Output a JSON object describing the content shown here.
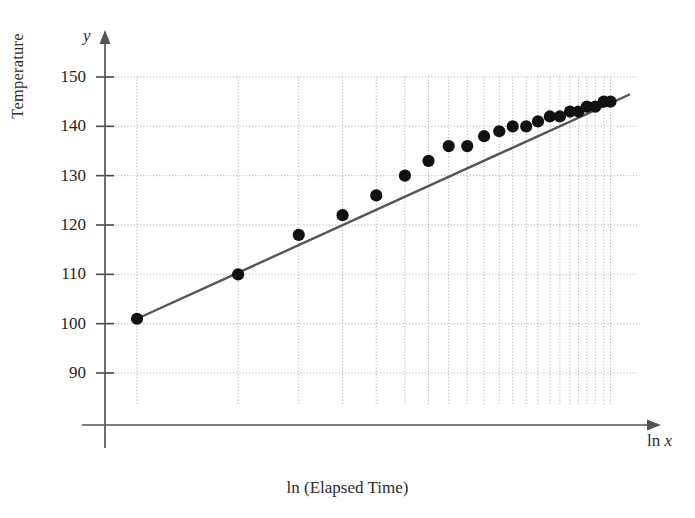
{
  "chart_data": {
    "type": "scatter",
    "title": "",
    "xlabel": "ln (Elapsed Time)",
    "ylabel": "Temperature",
    "x_axis_symbol_prefix": "ln ",
    "x_axis_symbol_var": "x",
    "y_axis_symbol": "y",
    "yticks": [
      150,
      140,
      130,
      120,
      110,
      100,
      90
    ],
    "ylim": [
      84,
      155
    ],
    "xlim": [
      0.0,
      3.35
    ],
    "x_scale": "log-spaced-gridlines",
    "grid": true,
    "grid_style": "dotted",
    "legend": "none",
    "x_gridlines": [
      0.3,
      0.9,
      1.26,
      1.52,
      1.72,
      1.89,
      2.03,
      2.15,
      2.26,
      2.36,
      2.45,
      2.53,
      2.61,
      2.68,
      2.75,
      2.81,
      2.87,
      2.92,
      2.97,
      3.02,
      3.07,
      3.11
    ],
    "series": [
      {
        "name": "Temperature observations",
        "marker": "filled-circle",
        "color": "#111111",
        "points": [
          {
            "x": 0.3,
            "y": 101
          },
          {
            "x": 0.9,
            "y": 110
          },
          {
            "x": 1.26,
            "y": 118
          },
          {
            "x": 1.52,
            "y": 122
          },
          {
            "x": 1.72,
            "y": 126
          },
          {
            "x": 1.89,
            "y": 130
          },
          {
            "x": 2.03,
            "y": 133
          },
          {
            "x": 2.15,
            "y": 136
          },
          {
            "x": 2.26,
            "y": 136
          },
          {
            "x": 2.36,
            "y": 138
          },
          {
            "x": 2.45,
            "y": 139
          },
          {
            "x": 2.53,
            "y": 140
          },
          {
            "x": 2.61,
            "y": 140
          },
          {
            "x": 2.68,
            "y": 141
          },
          {
            "x": 2.75,
            "y": 142
          },
          {
            "x": 2.81,
            "y": 142
          },
          {
            "x": 2.87,
            "y": 143
          },
          {
            "x": 2.92,
            "y": 143
          },
          {
            "x": 2.97,
            "y": 144
          },
          {
            "x": 3.02,
            "y": 144
          },
          {
            "x": 3.07,
            "y": 145
          },
          {
            "x": 3.11,
            "y": 145
          }
        ]
      }
    ],
    "trend_line": {
      "name": "least-squares regression line",
      "color": "#555555",
      "x_start": 0.3,
      "y_start": 101,
      "x_end": 3.22,
      "y_end": 146.4
    }
  }
}
